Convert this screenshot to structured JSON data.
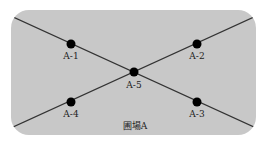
{
  "diagram": {
    "title": "圃場A",
    "field_color": "#c8c8c8",
    "line_color": "#333333",
    "dot_color": "#000000",
    "points": [
      {
        "id": "A-1",
        "label": "A-1",
        "x": 71,
        "y": 44
      },
      {
        "id": "A-2",
        "label": "A-2",
        "x": 197,
        "y": 44
      },
      {
        "id": "A-5",
        "label": "A-5",
        "x": 134,
        "y": 72
      },
      {
        "id": "A-4",
        "label": "A-4",
        "x": 71,
        "y": 102
      },
      {
        "id": "A-3",
        "label": "A-3",
        "x": 197,
        "y": 102
      }
    ]
  }
}
